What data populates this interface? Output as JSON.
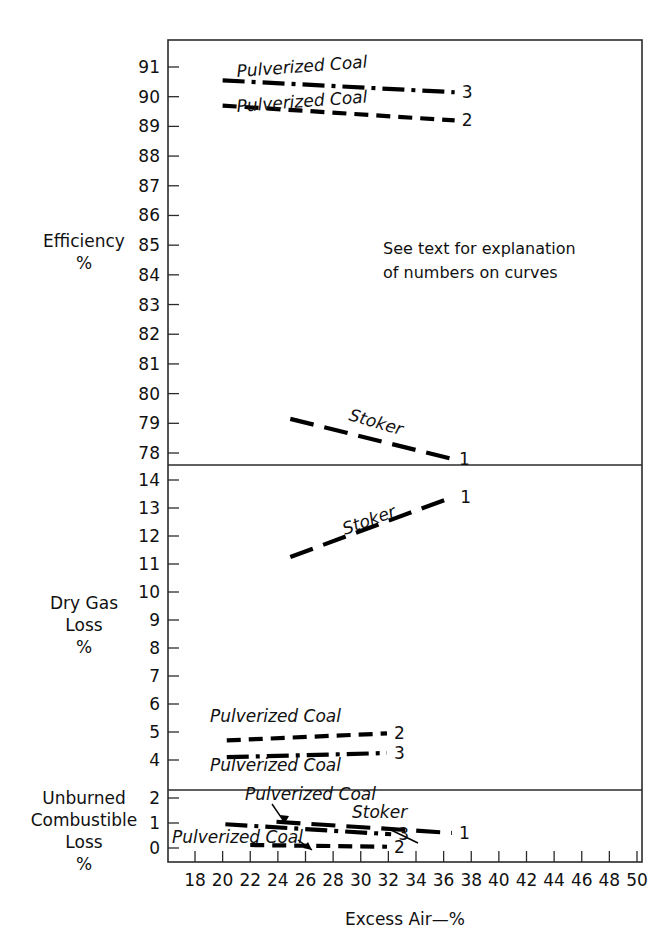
{
  "chart_data": {
    "type": "line",
    "title": "",
    "xlabel": "Excess Air—%",
    "xlim": [
      17,
      51
    ],
    "xticks": [
      18,
      20,
      22,
      24,
      26,
      28,
      30,
      32,
      34,
      36,
      38,
      40,
      42,
      44,
      46,
      48,
      50
    ],
    "annotation": "See text for explanation\nof numbers on curves",
    "annotation_line1": "See text for explanation",
    "annotation_line2": "of numbers on curves",
    "panels": [
      {
        "id": "efficiency",
        "ylabel_line1": "Efficiency",
        "ylabel_line2": "%",
        "ylim": [
          77.5,
          91.5
        ],
        "yticks": [
          78,
          79,
          80,
          81,
          82,
          83,
          84,
          85,
          86,
          87,
          88,
          89,
          90,
          91
        ],
        "series": [
          {
            "name": "Pulverized Coal",
            "number": "3",
            "style": "dashdot",
            "label": "Pulverized Coal",
            "x": [
              20.0,
              36.8
            ],
            "y": [
              90.55,
              90.15
            ]
          },
          {
            "name": "Pulverized Coal",
            "number": "2",
            "style": "dashed",
            "label": "Pulverized Coal",
            "x": [
              20.0,
              36.8
            ],
            "y": [
              89.7,
              89.2
            ]
          },
          {
            "name": "Stoker",
            "number": "1",
            "style": "longdash",
            "label": "Stoker",
            "x": [
              24.9,
              36.6
            ],
            "y": [
              79.15,
              77.8
            ]
          }
        ]
      },
      {
        "id": "dry-gas-loss",
        "ylabel_line1": "Dry Gas",
        "ylabel_line2": "Loss",
        "ylabel_line3": "%",
        "ylim": [
          3.4,
          14.6
        ],
        "yticks": [
          4,
          5,
          6,
          7,
          8,
          9,
          10,
          11,
          12,
          13,
          14
        ],
        "series": [
          {
            "name": "Stoker",
            "number": "1",
            "style": "longdash",
            "label": "Stoker",
            "x": [
              24.9,
              36.7
            ],
            "y": [
              11.25,
              13.4
            ]
          },
          {
            "name": "Pulverized Coal",
            "number": "2",
            "style": "dashed",
            "label": "Pulverized Coal",
            "x": [
              20.3,
              31.9
            ],
            "y": [
              4.7,
              4.95
            ]
          },
          {
            "name": "Pulverized Coal",
            "number": "3",
            "style": "dashdot",
            "label": "Pulverized Coal",
            "x": [
              20.3,
              31.9
            ],
            "y": [
              4.1,
              4.25
            ]
          }
        ]
      },
      {
        "id": "unburned-combustible-loss",
        "ylabel_line1": "Unburned",
        "ylabel_line2": "Combustible",
        "ylabel_line3": "Loss",
        "ylabel_line4": "%",
        "ylim": [
          -0.3,
          2.3
        ],
        "yticks": [
          0,
          1,
          2
        ],
        "series": [
          {
            "name": "Pulverized Coal",
            "number": "3",
            "style": "dashdot",
            "label": "Pulverized Coal",
            "x": [
              20.2,
              32.2
            ],
            "y": [
              0.95,
              0.55
            ]
          },
          {
            "name": "Stoker",
            "number": "1",
            "style": "longdash",
            "label": "Stoker",
            "x": [
              23.9,
              36.6
            ],
            "y": [
              1.05,
              0.6
            ]
          },
          {
            "name": "Pulverized Coal",
            "number": "2",
            "style": "dashed",
            "label": "Pulverized Coal",
            "x": [
              22.0,
              31.9
            ],
            "y": [
              0.12,
              0.05
            ]
          }
        ]
      }
    ]
  },
  "axis": {
    "x_title": "Excess Air—%",
    "x_ticks": [
      "18",
      "20",
      "22",
      "24",
      "26",
      "28",
      "30",
      "32",
      "34",
      "36",
      "38",
      "40",
      "42",
      "44",
      "46",
      "48",
      "50"
    ],
    "panel_top_y_ticks": [
      "91",
      "90",
      "89",
      "88",
      "87",
      "86",
      "85",
      "84",
      "83",
      "82",
      "81",
      "80",
      "79",
      "78"
    ],
    "panel_mid_y_ticks": [
      "14",
      "13",
      "12",
      "11",
      "10",
      "9",
      "8",
      "7",
      "6",
      "5",
      "4"
    ],
    "panel_bot_y_ticks": [
      "2",
      "1",
      "0"
    ]
  },
  "labels": {
    "efficiency_l1": "Efficiency",
    "efficiency_l2": "%",
    "drygas_l1": "Dry Gas",
    "drygas_l2": "Loss",
    "drygas_l3": "%",
    "unburned_l1": "Unburned",
    "unburned_l2": "Combustible",
    "unburned_l3": "Loss",
    "unburned_l4": "%",
    "note_l1": "See text for explanation",
    "note_l2": "of numbers on curves",
    "pulverized_coal": "Pulverized Coal",
    "stoker": "Stoker",
    "num1": "1",
    "num2": "2",
    "num3": "3"
  },
  "colors": {
    "line": "#000000",
    "frame": "#2b2b2b",
    "background": "#ffffff",
    "text": "#111111"
  }
}
